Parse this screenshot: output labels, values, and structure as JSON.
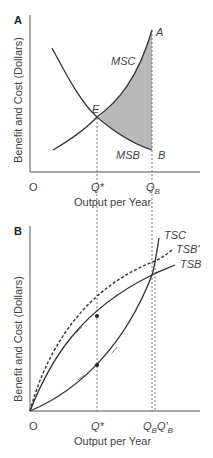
{
  "panels": [
    {
      "id": "A",
      "label": "A",
      "ylabel": "Benefit and Cost (Dollars)",
      "xlabel": "Output per Year",
      "origin": "O",
      "xticks": [
        "Q*",
        "Q",
        "B"
      ],
      "curves": {
        "msc": "MSC",
        "msb": "MSB"
      },
      "points": {
        "e": "E",
        "a": "A",
        "b": "B"
      }
    },
    {
      "id": "B",
      "label": "B",
      "ylabel": "Benefit and Cost (Dollars)",
      "xlabel": "Output per Year",
      "origin": "O",
      "curves": {
        "tsc": "TSC",
        "tsbp": "TSB'",
        "tsb": "TSB"
      },
      "ticks": {
        "qstar": "Q*",
        "qb": "Q",
        "qb_sub": "B",
        "qbp": "Q'",
        "qbp_sub": "B"
      }
    }
  ],
  "colors": {
    "curve": "#333333",
    "shade": "#b8b8b8",
    "axis": "#555555"
  }
}
